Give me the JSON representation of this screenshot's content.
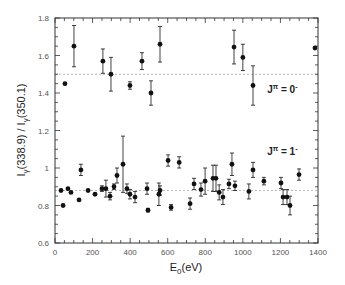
{
  "chart_data": {
    "type": "scatter",
    "title": "",
    "xlabel": "E0(eV)",
    "xlabel_main": "E",
    "xlabel_sub": "0",
    "xlabel_tail": "(eV)",
    "ylabel": "Iγ(338.9) / Iγ(350.1)",
    "ylabel_parts": [
      "I",
      "γ",
      "(338.9) / I",
      "γ",
      "(350.1)"
    ],
    "xlim": [
      0,
      1400
    ],
    "ylim": [
      0.6,
      1.8
    ],
    "x_ticks": [
      0,
      200,
      400,
      600,
      800,
      1000,
      1200,
      1400
    ],
    "x_tick_labels": [
      "0",
      "200",
      "400",
      "600",
      "800",
      "1000",
      "1200",
      "1400"
    ],
    "y_ticks": [
      0.6,
      0.8,
      1.0,
      1.2,
      1.4,
      1.6,
      1.8
    ],
    "y_tick_labels": [
      "0.6",
      "0.8",
      "1",
      "1.2",
      "1.4",
      "1.6",
      "1.8"
    ],
    "grid": false,
    "reference_lines": [
      {
        "y": 1.5,
        "style": "dotted"
      },
      {
        "y": 0.88,
        "style": "dotted"
      }
    ],
    "annotations": [
      {
        "text_main": "J",
        "text_sup": "π",
        "text_tail": " = 0",
        "text_sup2": "-",
        "x": 1130,
        "y": 1.4
      },
      {
        "text_main": "J",
        "text_sup": "π",
        "text_tail": " = 1",
        "text_sup2": "-",
        "x": 1130,
        "y": 1.07
      }
    ],
    "series": [
      {
        "name": "J^π = 0-",
        "points": [
          {
            "x": 53,
            "y": 1.45,
            "err": 0
          },
          {
            "x": 101,
            "y": 1.65,
            "err": 0.11
          },
          {
            "x": 255,
            "y": 1.57,
            "err": 0.065
          },
          {
            "x": 298,
            "y": 1.5,
            "err": 0.09
          },
          {
            "x": 399,
            "y": 1.44,
            "err": 0.02
          },
          {
            "x": 463,
            "y": 1.57,
            "err": 0.045
          },
          {
            "x": 511,
            "y": 1.4,
            "err": 0.065
          },
          {
            "x": 559,
            "y": 1.66,
            "err": 0.095
          },
          {
            "x": 953,
            "y": 1.645,
            "err": 0.09
          },
          {
            "x": 1000,
            "y": 1.59,
            "err": 0.07
          },
          {
            "x": 1054,
            "y": 1.44,
            "err": 0.105
          },
          {
            "x": 1384,
            "y": 1.64,
            "err": 0
          }
        ]
      },
      {
        "name": "J^π = 1-",
        "points": [
          {
            "x": 32,
            "y": 0.88,
            "err": 0
          },
          {
            "x": 43,
            "y": 0.8,
            "err": 0
          },
          {
            "x": 69,
            "y": 0.89,
            "err": 0
          },
          {
            "x": 85,
            "y": 0.87,
            "err": 0
          },
          {
            "x": 128,
            "y": 0.83,
            "err": 0
          },
          {
            "x": 138,
            "y": 0.99,
            "err": 0.03
          },
          {
            "x": 176,
            "y": 0.88,
            "err": 0
          },
          {
            "x": 213,
            "y": 0.86,
            "err": 0
          },
          {
            "x": 250,
            "y": 0.89,
            "err": 0.015
          },
          {
            "x": 271,
            "y": 0.89,
            "err": 0.045
          },
          {
            "x": 293,
            "y": 0.85,
            "err": 0.02
          },
          {
            "x": 314,
            "y": 0.9,
            "err": 0.015
          },
          {
            "x": 330,
            "y": 0.96,
            "err": 0.04
          },
          {
            "x": 362,
            "y": 1.02,
            "err": 0.15
          },
          {
            "x": 383,
            "y": 0.89,
            "err": 0.025
          },
          {
            "x": 399,
            "y": 0.86,
            "err": 0.025
          },
          {
            "x": 426,
            "y": 0.845,
            "err": 0.03
          },
          {
            "x": 490,
            "y": 0.89,
            "err": 0.03
          },
          {
            "x": 495,
            "y": 0.775,
            "err": 0.01
          },
          {
            "x": 553,
            "y": 0.86,
            "err": 0.06
          },
          {
            "x": 559,
            "y": 0.88,
            "err": 0.025
          },
          {
            "x": 602,
            "y": 1.04,
            "err": 0.03
          },
          {
            "x": 618,
            "y": 0.79,
            "err": 0.015
          },
          {
            "x": 661,
            "y": 1.03,
            "err": 0.03
          },
          {
            "x": 719,
            "y": 0.81,
            "err": 0.03
          },
          {
            "x": 740,
            "y": 0.915,
            "err": 0.03
          },
          {
            "x": 777,
            "y": 0.885,
            "err": 0.035
          },
          {
            "x": 799,
            "y": 0.93,
            "err": 0.07
          },
          {
            "x": 841,
            "y": 0.945,
            "err": 0.07
          },
          {
            "x": 857,
            "y": 0.945,
            "err": 0.07
          },
          {
            "x": 874,
            "y": 0.87,
            "err": 0.04
          },
          {
            "x": 894,
            "y": 0.845,
            "err": 0.04
          },
          {
            "x": 926,
            "y": 0.915,
            "err": 0.025
          },
          {
            "x": 942,
            "y": 1.02,
            "err": 0.06
          },
          {
            "x": 958,
            "y": 0.905,
            "err": 0.025
          },
          {
            "x": 1032,
            "y": 0.875,
            "err": 0.04
          },
          {
            "x": 1054,
            "y": 0.99,
            "err": 0.04
          },
          {
            "x": 1112,
            "y": 0.93,
            "err": 0.02
          },
          {
            "x": 1203,
            "y": 0.92,
            "err": 0.03
          },
          {
            "x": 1214,
            "y": 0.845,
            "err": 0.04
          },
          {
            "x": 1235,
            "y": 0.845,
            "err": 0.04
          },
          {
            "x": 1251,
            "y": 0.8,
            "err": 0.05
          },
          {
            "x": 1299,
            "y": 0.965,
            "err": 0.03
          }
        ]
      }
    ],
    "plot_box_px": {
      "left": 55,
      "right": 318,
      "top": 18,
      "bottom": 243
    },
    "colors": {
      "marker": "#111111",
      "axis": "#333333",
      "refline": "#bbbbbb"
    }
  }
}
